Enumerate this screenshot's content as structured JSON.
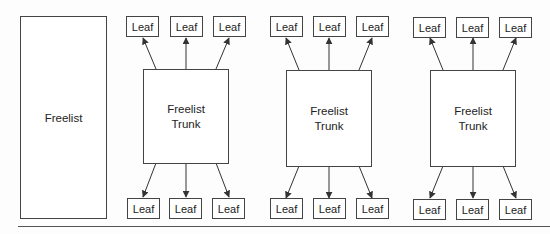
{
  "freelist": {
    "label": "Freelist"
  },
  "trunks": [
    {
      "label_line1": "Freelist",
      "label_line2": "Trunk",
      "top_leaves": [
        "Leaf",
        "Leaf",
        "Leaf"
      ],
      "bottom_leaves": [
        "Leaf",
        "Leaf",
        "Leaf"
      ]
    },
    {
      "label_line1": "Freelist",
      "label_line2": "Trunk",
      "top_leaves": [
        "Leaf",
        "Leaf",
        "Leaf"
      ],
      "bottom_leaves": [
        "Leaf",
        "Leaf",
        "Leaf"
      ]
    },
    {
      "label_line1": "Freelist",
      "label_line2": "Trunk",
      "top_leaves": [
        "Leaf",
        "Leaf",
        "Leaf"
      ],
      "bottom_leaves": [
        "Leaf",
        "Leaf",
        "Leaf"
      ]
    }
  ],
  "colors": {
    "stroke": "#444444",
    "background": "#fdfdfd"
  }
}
